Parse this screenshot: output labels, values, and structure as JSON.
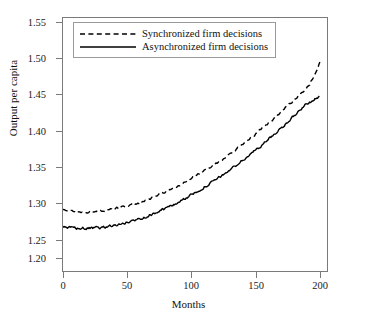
{
  "chart_data": {
    "type": "line",
    "title": "",
    "xlabel": "Months",
    "ylabel": "Output per capita",
    "xlim": [
      0,
      207
    ],
    "ylim": [
      1.181,
      1.567
    ],
    "xticks": [
      0,
      50,
      100,
      150,
      200
    ],
    "yticks": [
      1.2,
      1.25,
      1.3,
      1.35,
      1.4,
      1.45,
      1.5,
      1.55
    ],
    "ytick_labels": [
      "1.20",
      "1.25",
      "1.30",
      "1.35",
      "1.40",
      "1.45",
      "1.50",
      "1.55"
    ],
    "xtick_labels": [
      "0",
      "50",
      "100",
      "150",
      "200"
    ],
    "grid": false,
    "legend_position": "upper left",
    "series": [
      {
        "name": "Synchronized firm decisions",
        "style": "dashed",
        "color": "#000000",
        "x": [
          0,
          4,
          8,
          12,
          16,
          20,
          24,
          28,
          32,
          36,
          40,
          44,
          48,
          52,
          56,
          60,
          64,
          68,
          72,
          76,
          80,
          84,
          88,
          92,
          96,
          100,
          104,
          108,
          112,
          116,
          120,
          124,
          128,
          132,
          136,
          140,
          144,
          148,
          152,
          156,
          160,
          164,
          168,
          172,
          176,
          180,
          184,
          188,
          192,
          196,
          200
        ],
        "values": [
          1.2755,
          1.2752,
          1.2746,
          1.2741,
          1.2738,
          1.2736,
          1.274,
          1.2748,
          1.2757,
          1.2768,
          1.2782,
          1.2798,
          1.2817,
          1.2838,
          1.2861,
          1.2886,
          1.2913,
          1.2942,
          1.2973,
          1.3006,
          1.3041,
          1.3078,
          1.3117,
          1.3158,
          1.32,
          1.3244,
          1.3289,
          1.3336,
          1.3384,
          1.3434,
          1.3485,
          1.3538,
          1.3592,
          1.3648,
          1.3705,
          1.3764,
          1.3824,
          1.3886,
          1.3949,
          1.4014,
          1.408,
          1.4148,
          1.4217,
          1.4288,
          1.436,
          1.4434,
          1.451,
          1.4587,
          1.4666,
          1.483,
          1.4995
        ]
      },
      {
        "name": "Asynchronized firm decisions",
        "style": "solid",
        "color": "#000000",
        "x": [
          0,
          4,
          8,
          12,
          16,
          20,
          24,
          28,
          32,
          36,
          40,
          44,
          48,
          52,
          56,
          60,
          64,
          68,
          72,
          76,
          80,
          84,
          88,
          92,
          96,
          100,
          104,
          108,
          112,
          116,
          120,
          124,
          128,
          132,
          136,
          140,
          144,
          148,
          152,
          156,
          160,
          164,
          168,
          172,
          176,
          180,
          184,
          188,
          192,
          196,
          200
        ],
        "values": [
          1.25,
          1.2496,
          1.249,
          1.2486,
          1.2484,
          1.2484,
          1.2488,
          1.2495,
          1.2504,
          1.2516,
          1.253,
          1.2546,
          1.2565,
          1.2586,
          1.2609,
          1.2634,
          1.2661,
          1.269,
          1.2721,
          1.2754,
          1.2789,
          1.2826,
          1.2865,
          1.2906,
          1.2949,
          1.2993,
          1.3039,
          1.3086,
          1.3135,
          1.3185,
          1.3237,
          1.329,
          1.3345,
          1.3401,
          1.3459,
          1.3518,
          1.3578,
          1.364,
          1.3704,
          1.3769,
          1.3836,
          1.3904,
          1.3974,
          1.4045,
          1.4118,
          1.4192,
          1.4268,
          1.4345,
          1.44,
          1.444,
          1.448
        ]
      }
    ],
    "noise_amplitude": 0.0016
  },
  "axes": {
    "ylabel": "Output per capita",
    "xlabel": "Months",
    "ytick_labels": [
      "1.55",
      "1.50",
      "1.45",
      "1.40",
      "1.35",
      "1.30",
      "1.25",
      "1.20"
    ],
    "xtick_labels": [
      "0",
      "50",
      "100",
      "150",
      "200"
    ]
  },
  "legend": {
    "entries": [
      {
        "label": "Synchronized firm decisions",
        "style": "dashed"
      },
      {
        "label": "Asynchronized firm decisions",
        "style": "solid"
      }
    ]
  }
}
